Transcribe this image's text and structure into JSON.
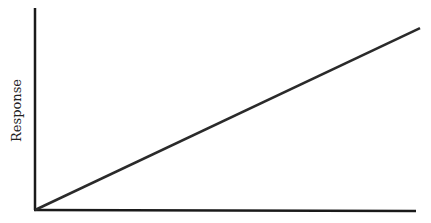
{
  "chart_data": {
    "type": "line",
    "title": "",
    "xlabel": "",
    "ylabel": "Response",
    "x": [
      0,
      1
    ],
    "series": [
      {
        "name": "Response",
        "values": [
          0,
          0.9
        ]
      }
    ],
    "xlim": [
      0,
      1
    ],
    "ylim": [
      0,
      1
    ],
    "grid": false,
    "legend": "none",
    "x_ticks": [],
    "y_ticks": []
  },
  "colors": {
    "axis": "#1a1a1a",
    "line": "#2a2a2a",
    "background": "#ffffff"
  }
}
